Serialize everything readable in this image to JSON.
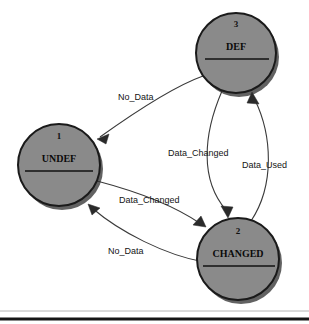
{
  "diagram": {
    "type": "state-machine",
    "nodes": [
      {
        "id": "undef",
        "number": "1",
        "name": "UNDEF",
        "cx": 59,
        "cy": 165,
        "r": 41
      },
      {
        "id": "changed",
        "number": "2",
        "name": "CHANGED",
        "cx": 238,
        "cy": 259,
        "r": 41
      },
      {
        "id": "def",
        "number": "3",
        "name": "DEF",
        "cx": 236,
        "cy": 53,
        "r": 40
      }
    ],
    "edges": [
      {
        "id": "def-to-undef",
        "from": "def",
        "to": "undef",
        "label": "No_Data",
        "label_x": 118,
        "label_y": 100
      },
      {
        "id": "def-to-changed",
        "from": "def",
        "to": "changed",
        "label": "Data_Changed",
        "label_x": 168,
        "label_y": 156
      },
      {
        "id": "changed-to-def",
        "from": "changed",
        "to": "def",
        "label": "Data_Used",
        "label_x": 242,
        "label_y": 168
      },
      {
        "id": "undef-to-changed",
        "from": "undef",
        "to": "changed",
        "label": "Data_Changed",
        "label_x": 119,
        "label_y": 203
      },
      {
        "id": "changed-to-undef",
        "from": "changed",
        "to": "undef",
        "label": "No_Data",
        "label_x": 108,
        "label_y": 254
      }
    ],
    "colors": {
      "node_fill": "#8a8a8a",
      "node_stroke": "#1a1a1a",
      "edge_stroke": "#3a3a3a",
      "label_text": "#141414",
      "background": "#ffffff",
      "bottom_rule": "#151515"
    }
  }
}
